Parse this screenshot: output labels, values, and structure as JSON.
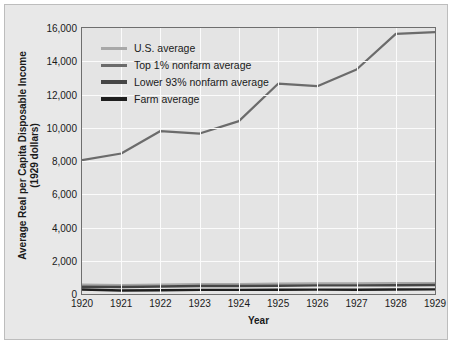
{
  "chart_data": {
    "type": "line",
    "title": "",
    "xlabel": "Year",
    "ylabel": "Average Real per Capita Disposable Income\n(1929 dollars)",
    "ylabel_line1": "Average Real per Capita Disposable Income",
    "ylabel_line2": "(1929 dollars)",
    "x": [
      1920,
      1921,
      1922,
      1923,
      1924,
      1925,
      1926,
      1927,
      1928,
      1929
    ],
    "categories": [
      "1920",
      "1921",
      "1922",
      "1923",
      "1924",
      "1925",
      "1926",
      "1927",
      "1928",
      "1929"
    ],
    "xlim": [
      1920,
      1929
    ],
    "ylim": [
      0,
      16000
    ],
    "yticks": [
      0,
      2000,
      4000,
      6000,
      8000,
      10000,
      12000,
      14000,
      16000
    ],
    "ytick_labels": [
      "0",
      "2,000",
      "4,000",
      "6,000",
      "8,000",
      "10,000",
      "12,000",
      "14,000",
      "16,000"
    ],
    "grid": true,
    "legend_position": "top-left inside",
    "series": [
      {
        "name": "U.S. average",
        "color": "#a8a8a8",
        "width": 2.2,
        "values": [
          560,
          540,
          570,
          600,
          600,
          620,
          640,
          640,
          650,
          660
        ]
      },
      {
        "name": "Top 1% nonfarm average",
        "color": "#6b6b6b",
        "width": 2.2,
        "values": [
          8050,
          8450,
          9800,
          9650,
          10400,
          12650,
          12500,
          13500,
          15650,
          15750
        ]
      },
      {
        "name": "Lower 93% nonfarm average",
        "color": "#454545",
        "width": 2.4,
        "values": [
          440,
          420,
          450,
          480,
          480,
          500,
          520,
          520,
          530,
          540
        ]
      },
      {
        "name": "Farm average",
        "color": "#1e1e1e",
        "width": 2.4,
        "values": [
          270,
          210,
          230,
          250,
          250,
          260,
          265,
          260,
          270,
          280
        ]
      }
    ]
  },
  "legend": {
    "items": [
      {
        "label": "U.S. average",
        "color": "#a8a8a8"
      },
      {
        "label": "Top 1% nonfarm average",
        "color": "#6b6b6b"
      },
      {
        "label": "Lower 93% nonfarm average",
        "color": "#454545"
      },
      {
        "label": "Farm average",
        "color": "#1e1e1e"
      }
    ]
  },
  "colors": {
    "figure_background": "#e8e8e8",
    "plot_background": "#e4e4e4",
    "gridline": "#fbfbfb",
    "axis": "#6e6e6e",
    "text": "#1a1a1a"
  }
}
